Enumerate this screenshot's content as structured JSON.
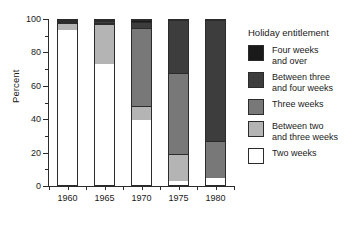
{
  "chart_data": {
    "type": "bar",
    "subtype": "stacked-100-percent",
    "title": "",
    "xlabel": "",
    "ylabel": "Percent",
    "ylim": [
      0,
      100
    ],
    "ytick_labels": [
      "0",
      "20",
      "40",
      "60",
      "80",
      "100"
    ],
    "ytick_values": [
      0,
      20,
      40,
      60,
      80,
      100
    ],
    "yminor_values": [
      10,
      30,
      50,
      70,
      90
    ],
    "grid": false,
    "legend_position": "right",
    "legend_title": "Holiday entitlement",
    "categories": [
      "1960",
      "1965",
      "1970",
      "1975",
      "1980"
    ],
    "series": [
      {
        "name": "Two weeks",
        "color": "#ffffff",
        "values": [
          95.0,
          73.5,
          39.5,
          2.5,
          4.0
        ]
      },
      {
        "name": "Between two and three weeks",
        "color": "#b4b4b4",
        "values": [
          4.5,
          24.5,
          8.5,
          16.5,
          0.0
        ]
      },
      {
        "name": "Three weeks",
        "color": "#787878",
        "values": [
          0.3,
          0.5,
          47.0,
          49.0,
          22.5
        ]
      },
      {
        "name": "Between three and four weeks",
        "color": "#3d3d3d",
        "values": [
          0.1,
          1.0,
          4.0,
          32.0,
          73.5
        ]
      },
      {
        "name": "Four weeks and over",
        "color": "#1a1a1a",
        "values": [
          0.1,
          0.5,
          1.0,
          0.0,
          0.0
        ]
      }
    ]
  },
  "legend": {
    "title": "Holiday entitlement",
    "items": [
      {
        "label": "Four weeks\nand over",
        "color": "#1a1a1a"
      },
      {
        "label": "Between three\nand four weeks",
        "color": "#3d3d3d"
      },
      {
        "label": "Three weeks",
        "color": "#787878"
      },
      {
        "label": "Between two\nand three weeks",
        "color": "#b4b4b4"
      },
      {
        "label": "Two weeks",
        "color": "#ffffff"
      }
    ]
  }
}
